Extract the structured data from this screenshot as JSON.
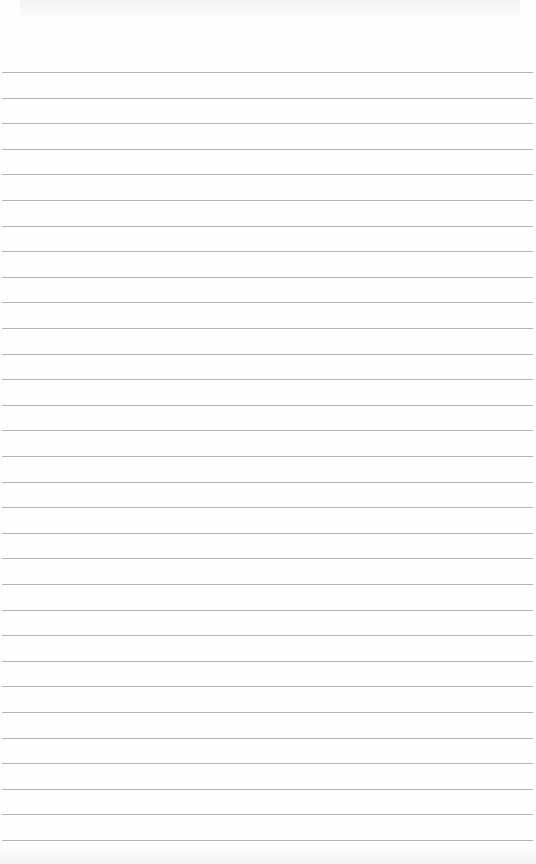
{
  "page": {
    "type": "lined-paper",
    "background_color": "#fefefe",
    "rule_color": "#b4b4b4",
    "rule_count": 31,
    "first_rule_y": 72,
    "rule_spacing": 25.6,
    "rule_left": 2,
    "rule_width": 531
  }
}
